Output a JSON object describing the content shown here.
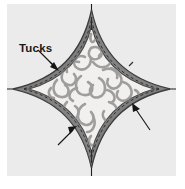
{
  "figure": {
    "kind": "sewing-pattern-diagram",
    "panel": {
      "background_color": "#ebebeb",
      "outer_background_color": "#ffffff"
    },
    "annotations": {
      "tucks_label": "Tucks"
    },
    "shape": {
      "name": "four-pointed-star",
      "band_fill_color": "#7e7e7e",
      "band_outline_color": "#3c3c3c",
      "center_fill_color": "#f2f0ee",
      "ornament_color": "#9c9a98",
      "stitch_line_color": "#2e2e2e"
    },
    "axes": {
      "line_color": "#1f1f1f",
      "vertical": "vertical-center-line",
      "horizontal": "horizontal-center-line"
    },
    "pointers": [
      {
        "name": "tucks-leader-arrow",
        "from": [
          31,
          46
        ],
        "to": [
          50,
          65
        ]
      },
      {
        "name": "right-pointer-arrow",
        "from": [
          143,
          126
        ],
        "to": [
          126,
          101
        ]
      },
      {
        "name": "bottom-left-pointer-arrow",
        "from": [
          51,
          141
        ],
        "to": [
          68,
          124
        ]
      }
    ]
  }
}
